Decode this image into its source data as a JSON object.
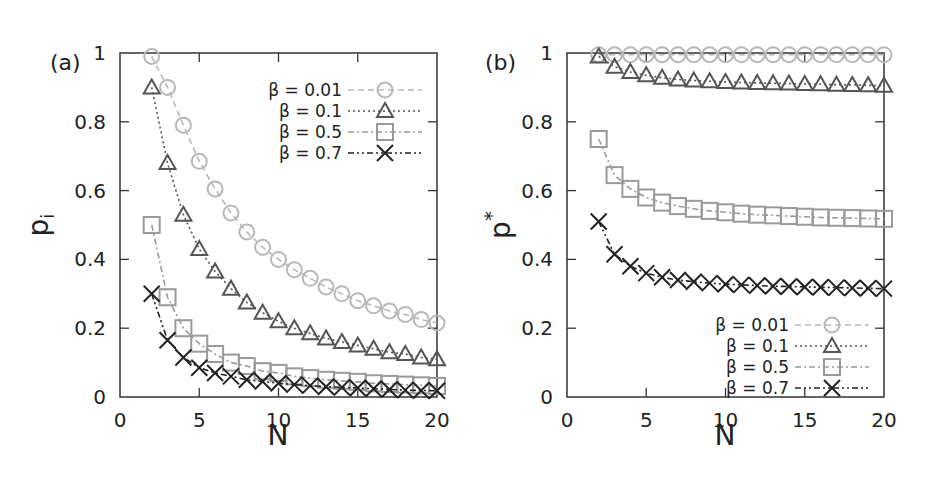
{
  "chart_data": [
    {
      "panel": "(a)",
      "type": "line",
      "title": "",
      "xlabel": "N",
      "ylabel": "p_i",
      "xlim": [
        0,
        20
      ],
      "ylim": [
        0,
        1
      ],
      "xticks": [
        0,
        5,
        10,
        15,
        20
      ],
      "yticks": [
        0,
        0.2,
        0.4,
        0.6,
        0.8,
        1
      ],
      "grid": false,
      "legend_position": "upper right",
      "x": [
        2,
        3,
        4,
        5,
        6,
        7,
        8,
        9,
        10,
        11,
        12,
        13,
        14,
        15,
        16,
        17,
        18,
        19,
        20
      ],
      "series": [
        {
          "name": "β = 0.01",
          "marker": "circle",
          "line": "dashed",
          "color": "#b8b8b8",
          "values": [
            0.99,
            0.9,
            0.79,
            0.685,
            0.605,
            0.535,
            0.48,
            0.435,
            0.4,
            0.37,
            0.345,
            0.32,
            0.3,
            0.28,
            0.265,
            0.25,
            0.24,
            0.225,
            0.215
          ]
        },
        {
          "name": "β = 0.1",
          "marker": "triangle",
          "line": "dotted",
          "color": "#555555",
          "values": [
            0.9,
            0.68,
            0.53,
            0.43,
            0.365,
            0.315,
            0.275,
            0.245,
            0.22,
            0.2,
            0.185,
            0.17,
            0.16,
            0.15,
            0.14,
            0.13,
            0.125,
            0.115,
            0.11
          ]
        },
        {
          "name": "β = 0.5",
          "marker": "square",
          "line": "dash-dot",
          "color": "#9a9a9a",
          "values": [
            0.5,
            0.29,
            0.2,
            0.155,
            0.125,
            0.1,
            0.09,
            0.075,
            0.07,
            0.06,
            0.055,
            0.05,
            0.047,
            0.044,
            0.04,
            0.038,
            0.036,
            0.034,
            0.032
          ]
        },
        {
          "name": "β = 0.7",
          "marker": "cross",
          "line": "dash-dot-dot",
          "color": "#222222",
          "values": [
            0.3,
            0.165,
            0.115,
            0.085,
            0.07,
            0.06,
            0.05,
            0.045,
            0.04,
            0.036,
            0.033,
            0.03,
            0.028,
            0.026,
            0.024,
            0.022,
            0.02,
            0.019,
            0.018
          ]
        }
      ]
    },
    {
      "panel": "(b)",
      "type": "line",
      "title": "",
      "xlabel": "N",
      "ylabel": "p*",
      "xlim": [
        0,
        20
      ],
      "ylim": [
        0,
        1
      ],
      "xticks": [
        0,
        5,
        10,
        15,
        20
      ],
      "yticks": [
        0,
        0.2,
        0.4,
        0.6,
        0.8,
        1
      ],
      "grid": false,
      "legend_position": "lower right",
      "x": [
        2,
        3,
        4,
        5,
        6,
        7,
        8,
        9,
        10,
        11,
        12,
        13,
        14,
        15,
        16,
        17,
        18,
        19,
        20
      ],
      "series": [
        {
          "name": "β = 0.01",
          "marker": "circle",
          "line": "dashed",
          "color": "#b8b8b8",
          "values": [
            0.995,
            0.995,
            0.995,
            0.995,
            0.995,
            0.995,
            0.995,
            0.995,
            0.995,
            0.995,
            0.995,
            0.995,
            0.995,
            0.995,
            0.995,
            0.995,
            0.995,
            0.995,
            0.995
          ]
        },
        {
          "name": "β = 0.1",
          "marker": "triangle",
          "line": "dotted",
          "color": "#555555",
          "values": [
            0.99,
            0.96,
            0.945,
            0.935,
            0.928,
            0.923,
            0.92,
            0.918,
            0.916,
            0.914,
            0.913,
            0.912,
            0.911,
            0.91,
            0.909,
            0.908,
            0.907,
            0.906,
            0.905
          ]
        },
        {
          "name": "β = 0.5",
          "marker": "square",
          "line": "dash-dot",
          "color": "#9a9a9a",
          "values": [
            0.75,
            0.645,
            0.605,
            0.58,
            0.565,
            0.555,
            0.547,
            0.541,
            0.537,
            0.533,
            0.53,
            0.528,
            0.526,
            0.524,
            0.522,
            0.521,
            0.52,
            0.519,
            0.518
          ]
        },
        {
          "name": "β = 0.7",
          "marker": "cross",
          "line": "dash-dot-dot",
          "color": "#222222",
          "values": [
            0.51,
            0.415,
            0.38,
            0.36,
            0.348,
            0.34,
            0.335,
            0.331,
            0.328,
            0.326,
            0.324,
            0.322,
            0.321,
            0.32,
            0.319,
            0.318,
            0.317,
            0.316,
            0.315
          ]
        }
      ]
    }
  ],
  "panels": [
    {
      "label": "(a)",
      "ylabel_main": "p",
      "ylabel_sub": "i",
      "xlabel": "N",
      "xtick_labels": [
        "0",
        "5",
        "10",
        "15",
        "20"
      ],
      "ytick_labels": [
        "0",
        "0.2",
        "0.4",
        "0.6",
        "0.8",
        "1"
      ],
      "legend": [
        "β = 0.01",
        "β = 0.1",
        "β = 0.5",
        "β = 0.7"
      ]
    },
    {
      "label": "(b)",
      "ylabel_main": "p",
      "ylabel_sup": "*",
      "xlabel": "N",
      "xtick_labels": [
        "0",
        "5",
        "10",
        "15",
        "20"
      ],
      "ytick_labels": [
        "0",
        "0.2",
        "0.4",
        "0.6",
        "0.8",
        "1"
      ],
      "legend": [
        "β = 0.01",
        "β = 0.1",
        "β = 0.5",
        "β = 0.7"
      ]
    }
  ]
}
